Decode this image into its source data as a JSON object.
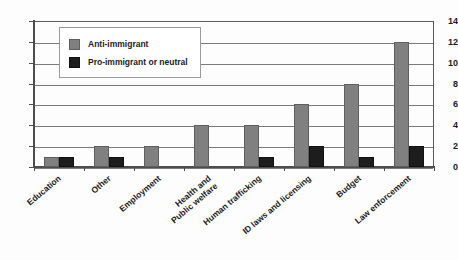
{
  "chart_data": {
    "type": "bar",
    "title": "",
    "subtitle": "",
    "xlabel": "",
    "ylabel": "",
    "ylim": [
      0,
      14
    ],
    "ytick_values": [
      0,
      2,
      4,
      6,
      8,
      10,
      12,
      14
    ],
    "ytick_labels": [
      "0",
      "2",
      "4",
      "6",
      "8",
      "10",
      "12",
      "14"
    ],
    "grid": "horizontal",
    "legend_position": "upper-left-inside",
    "categories": [
      "Education",
      "Other",
      "Employment",
      "Health and\nPublic welfare",
      "Human trafficking",
      "ID laws and licensing",
      "Budget",
      "Law enforcement"
    ],
    "series": [
      {
        "name": "Anti-immigrant",
        "color": "#808080",
        "values": [
          1,
          2,
          2,
          4,
          4,
          6,
          8,
          12
        ]
      },
      {
        "name": "Pro-immigrant or neutral",
        "color": "#1d1d1d",
        "values": [
          1,
          1,
          0,
          0,
          1,
          2,
          1,
          2
        ]
      }
    ],
    "annotations": []
  },
  "legend": {
    "items": [
      {
        "label": "Anti-immigrant",
        "swatch": "anti"
      },
      {
        "label": "Pro-immigrant or neutral",
        "swatch": "pro"
      }
    ]
  },
  "colors": {
    "anti_immigrant": "#808080",
    "pro_immigrant": "#1d1d1d",
    "axis": "#4d4d4d",
    "gridline": "#7b7b7b",
    "background": "#fdfdfd"
  }
}
